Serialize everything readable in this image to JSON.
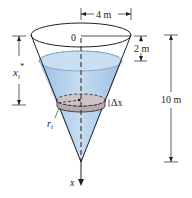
{
  "figure": {
    "labels": {
      "top_width": "4 m",
      "origin": "0",
      "depth_offset": "2 m",
      "height": "10 m",
      "slice_depth": "x",
      "slice_depth_sub": "i",
      "slice_depth_sup": "*",
      "slice_thickness": "Δx",
      "slice_radius": "r",
      "slice_radius_sub": "i",
      "axis": "x"
    },
    "colors": {
      "water": "#b9d4ec",
      "water_dark": "#8fb6dc",
      "slice": "#b7a9ae",
      "outline": "#231f20"
    }
  }
}
